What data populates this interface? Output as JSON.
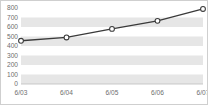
{
  "chart_data": {
    "type": "line",
    "title": "",
    "subtitle": "",
    "xlabel": "",
    "ylabel": "",
    "categories": [
      "6/03",
      "6/04",
      "6/05",
      "6/06",
      "6/07"
    ],
    "series": [
      {
        "name": "series-1",
        "values": [
          455,
          490,
          580,
          665,
          790
        ],
        "line_color": "#3a3a3a",
        "marker": "circle-open",
        "marker_fill": "#ffffff"
      }
    ],
    "ylim": [
      0,
      800
    ],
    "ytick_step": 100,
    "yticks": [
      0,
      100,
      200,
      300,
      400,
      500,
      600,
      700,
      800
    ],
    "ytick_labels": [
      "0",
      "100",
      "200",
      "300",
      "400",
      "500",
      "600",
      "700",
      "800"
    ],
    "xtick_labels": [
      "6/03",
      "6/04",
      "6/05",
      "6/06",
      "6/07"
    ],
    "grid": "horizontal-bands",
    "band_color": "#e6e6e6",
    "plot_background": "#ffffff",
    "legend": "none",
    "legend_position": "none",
    "border_color": "#cfcfcf",
    "tick_label_color": "#6e6e6e"
  }
}
